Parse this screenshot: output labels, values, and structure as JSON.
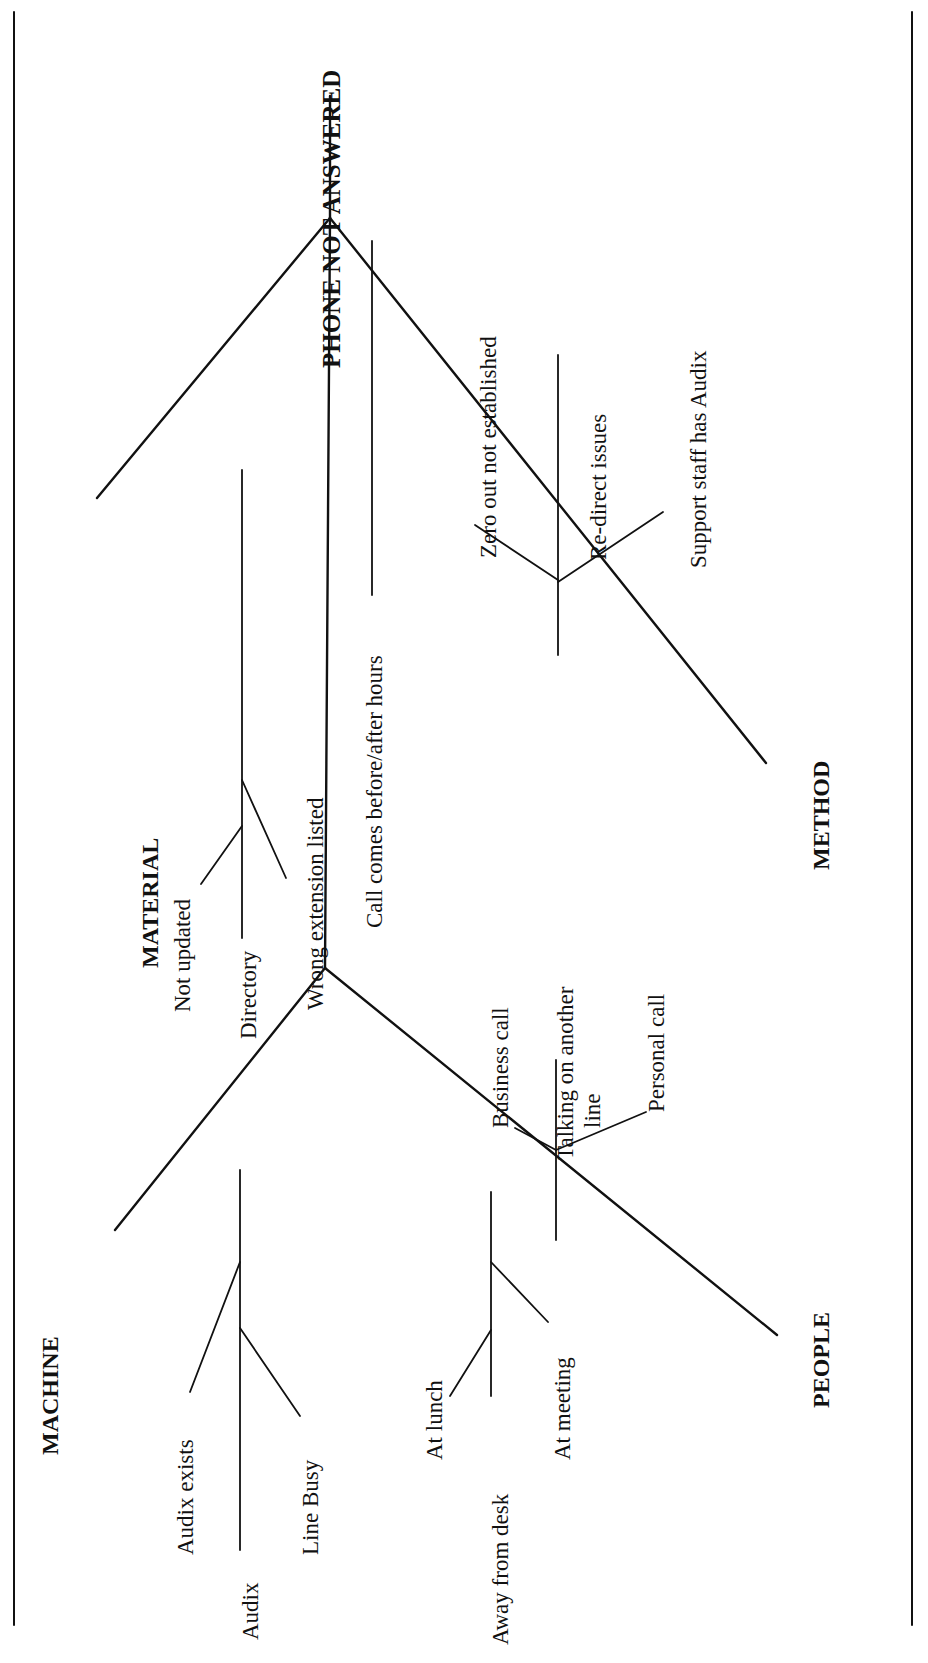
{
  "diagram": {
    "type": "fishbone (cause-and-effect), rotated 90° counter-clockwise",
    "effect": "PHONE NOT ANSWERED",
    "categories": {
      "material": {
        "label": "MATERIAL",
        "causes": {
          "directory": "Directory",
          "not_updated": "Not updated",
          "wrong_extension": "Wrong extension listed"
        }
      },
      "method": {
        "label": "METHOD",
        "causes": {
          "call_hours": "Call comes before/after hours",
          "zero_out": "Zero out not established",
          "redirect": "Re-direct issues",
          "support_staff": "Support staff has Audix"
        }
      },
      "machine": {
        "label": "MACHINE",
        "causes": {
          "audix": "Audix",
          "audix_exists": "Audix exists",
          "line_busy": "Line Busy"
        }
      },
      "people": {
        "label": "PEOPLE",
        "causes": {
          "away_from_desk": "Away from desk",
          "at_lunch": "At lunch",
          "at_meeting": "At meeting",
          "talking_line1": "Talking on another",
          "talking_line2": "line",
          "business_call": "Business call",
          "personal_call": "Personal call"
        }
      }
    }
  }
}
